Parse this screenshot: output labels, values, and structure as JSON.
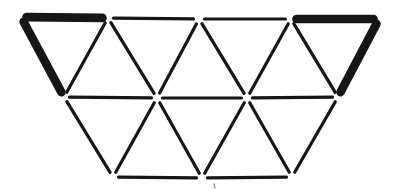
{
  "figure": {
    "canvas": {
      "width": 399,
      "height": 191
    },
    "colors": {
      "stroke": "#161616",
      "background": "#ffffff",
      "stray_mark": "#8f8f8f"
    },
    "stroke_widths": {
      "thick": 8.6,
      "thin": 3.2
    },
    "vertex_gap": 5.5,
    "vertices": {
      "T0": [
        21,
        17
      ],
      "T1": [
        108,
        18
      ],
      "T2": [
        199,
        19
      ],
      "T3": [
        291,
        19
      ],
      "T4": [
        379,
        19
      ],
      "M0": [
        64,
        97
      ],
      "M1": [
        157,
        98
      ],
      "M2": [
        247,
        98
      ],
      "M3": [
        338,
        97
      ],
      "B0": [
        113,
        177
      ],
      "B1": [
        202,
        178
      ],
      "B2": [
        292,
        177
      ]
    },
    "segments": [
      {
        "id": "top-edge-1",
        "from": "T0",
        "to": "T1",
        "weight": "thick"
      },
      {
        "id": "top-edge-2",
        "from": "T1",
        "to": "T2",
        "weight": "thin"
      },
      {
        "id": "top-edge-3",
        "from": "T2",
        "to": "T3",
        "weight": "thin"
      },
      {
        "id": "top-edge-4",
        "from": "T3",
        "to": "T4",
        "weight": "thick"
      },
      {
        "id": "left-slant-edge",
        "from": "T0",
        "to": "M0",
        "weight": "thick"
      },
      {
        "id": "upper-diagonal-1",
        "from": "T1",
        "to": "M0",
        "weight": "thin"
      },
      {
        "id": "upper-diagonal-2",
        "from": "T1",
        "to": "M1",
        "weight": "thin"
      },
      {
        "id": "upper-diagonal-3",
        "from": "T2",
        "to": "M1",
        "weight": "thin"
      },
      {
        "id": "upper-diagonal-4",
        "from": "T2",
        "to": "M2",
        "weight": "thin"
      },
      {
        "id": "upper-diagonal-5",
        "from": "T3",
        "to": "M2",
        "weight": "thin"
      },
      {
        "id": "upper-diagonal-6",
        "from": "T3",
        "to": "M3",
        "weight": "thin"
      },
      {
        "id": "right-slant-edge",
        "from": "T4",
        "to": "M3",
        "weight": "thick"
      },
      {
        "id": "middle-edge-1",
        "from": "M0",
        "to": "M1",
        "weight": "thin"
      },
      {
        "id": "middle-edge-2",
        "from": "M1",
        "to": "M2",
        "weight": "thin"
      },
      {
        "id": "middle-edge-3",
        "from": "M2",
        "to": "M3",
        "weight": "thin"
      },
      {
        "id": "lower-diagonal-1",
        "from": "M0",
        "to": "B0",
        "weight": "thin"
      },
      {
        "id": "lower-diagonal-2",
        "from": "M1",
        "to": "B0",
        "weight": "thin"
      },
      {
        "id": "lower-diagonal-3",
        "from": "M1",
        "to": "B1",
        "weight": "thin"
      },
      {
        "id": "lower-diagonal-4",
        "from": "M2",
        "to": "B1",
        "weight": "thin"
      },
      {
        "id": "lower-diagonal-5",
        "from": "M2",
        "to": "B2",
        "weight": "thin"
      },
      {
        "id": "lower-diagonal-6",
        "from": "M3",
        "to": "B2",
        "weight": "thin"
      },
      {
        "id": "bottom-edge-1",
        "from": "B0",
        "to": "B1",
        "weight": "thin"
      },
      {
        "id": "bottom-edge-2",
        "from": "B1",
        "to": "B2",
        "weight": "thin"
      }
    ],
    "stray_mark": {
      "x1": 214,
      "y1": 184,
      "x2": 215,
      "y2": 188,
      "width": 1.3
    }
  }
}
